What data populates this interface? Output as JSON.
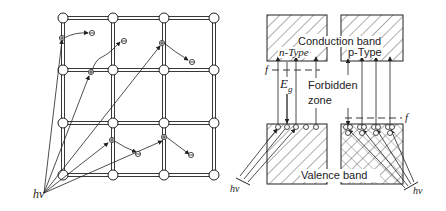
{
  "lattice": {
    "photon_label": "hν",
    "carrier_symbols": {
      "hole": "⊕",
      "electron": "⊖"
    }
  },
  "band_diagram": {
    "conduction_band": "Conduction band",
    "valence_band": "Valence band",
    "n_type": "n-Type",
    "p_type": "p-Type",
    "fermi_left": "f",
    "fermi_right": "f",
    "gap": "E",
    "gap_sub": "g",
    "forbidden_line1": "Forbidden",
    "forbidden_line2": "zone",
    "photon_left": "hν",
    "photon_right": "hν"
  },
  "colors": {
    "ink": "#222222",
    "background": "#ffffff"
  }
}
